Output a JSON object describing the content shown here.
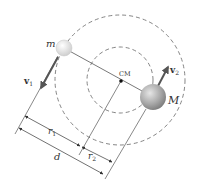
{
  "diagram": {
    "labels": {
      "m": "m",
      "M": "M",
      "cm": "CM",
      "v1": "v",
      "v1_sub": "1",
      "v2": "v",
      "v2_sub": "2",
      "r1": "r",
      "r1_sub": "1",
      "r2": "r",
      "r2_sub": "2",
      "d": "d"
    },
    "colors": {
      "line": "#555555",
      "dashed_orbit": "#777777",
      "arrow_velocity": "#555555",
      "small_mass_fill": "#eeeeee",
      "large_mass_fill": "#9a9a9a",
      "cm_dot": "#111111"
    },
    "elements": {
      "outer_orbit": {
        "cx": 120,
        "cy": 80,
        "r": 65,
        "style": "dashed"
      },
      "inner_orbit": {
        "cx": 120,
        "cy": 80,
        "r": 33,
        "style": "dashed"
      },
      "small_mass": {
        "cx": 64,
        "cy": 48,
        "r": 8
      },
      "large_mass": {
        "cx": 153,
        "cy": 97,
        "r": 13
      },
      "center_of_mass": {
        "x": 121,
        "y": 81
      }
    }
  }
}
